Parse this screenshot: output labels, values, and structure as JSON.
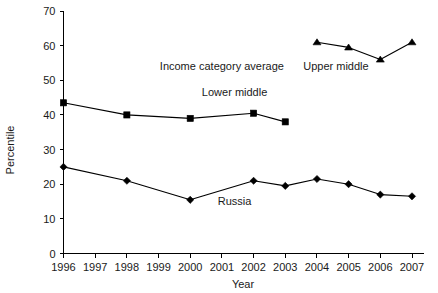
{
  "chart_data": {
    "type": "line",
    "title": "",
    "xlabel": "Year",
    "ylabel": "Percentile",
    "xlim": [
      1996,
      2007
    ],
    "ylim": [
      0,
      70
    ],
    "ytick_step": 10,
    "grid": false,
    "legend": "inline-annotations",
    "xticks": [
      "1996",
      "1997",
      "1998",
      "1999",
      "2000",
      "2001",
      "2002",
      "2003",
      "2004",
      "2005",
      "2006",
      "2007"
    ],
    "yticks": [
      "0",
      "10",
      "20",
      "30",
      "40",
      "50",
      "60",
      "70"
    ],
    "annotations": [
      {
        "text": "Income category average",
        "x": 2001.0,
        "y": 53.0
      },
      {
        "text": "Upper middle",
        "x": 2004.6,
        "y": 53.0
      },
      {
        "text": "Lower middle",
        "x": 2001.4,
        "y": 45.5
      },
      {
        "text": "Russia",
        "x": 2001.4,
        "y": 14.0
      }
    ],
    "series": [
      {
        "name": "Lower middle",
        "marker": "square",
        "x": [
          1996,
          1998,
          2000,
          2002,
          2003
        ],
        "values": [
          43.5,
          40.0,
          39.0,
          40.5,
          38.0
        ]
      },
      {
        "name": "Russia",
        "marker": "diamond",
        "x": [
          1996,
          1998,
          2000,
          2002,
          2003,
          2004,
          2005,
          2006,
          2007
        ],
        "values": [
          25.0,
          21.0,
          15.5,
          21.0,
          19.5,
          21.5,
          20.0,
          17.0,
          16.5
        ]
      },
      {
        "name": "Upper middle",
        "marker": "triangle",
        "x": [
          2004,
          2005,
          2006,
          2007
        ],
        "values": [
          61.0,
          59.5,
          56.0,
          61.0
        ]
      }
    ],
    "colors": {
      "line": "#000000",
      "marker": "#000000",
      "axis": "#000000",
      "text": "#1a1a1a",
      "background": "#ffffff"
    }
  }
}
